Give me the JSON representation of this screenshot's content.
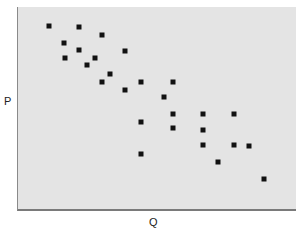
{
  "chart_data": {
    "type": "scatter",
    "title": "",
    "xlabel": "Q",
    "ylabel": "P",
    "grid": false,
    "legend": null,
    "xlim": [
      0,
      279
    ],
    "ylim": [
      0,
      204
    ],
    "background_color": "#e4e4e4",
    "marker_color": "#111111",
    "marker": "square",
    "points": [
      {
        "x": 31,
        "y": 185
      },
      {
        "x": 61,
        "y": 184
      },
      {
        "x": 84,
        "y": 176
      },
      {
        "x": 46,
        "y": 168
      },
      {
        "x": 61,
        "y": 161
      },
      {
        "x": 107,
        "y": 160
      },
      {
        "x": 47,
        "y": 153
      },
      {
        "x": 77,
        "y": 153
      },
      {
        "x": 69,
        "y": 146
      },
      {
        "x": 92,
        "y": 137
      },
      {
        "x": 84,
        "y": 129
      },
      {
        "x": 123,
        "y": 129
      },
      {
        "x": 155,
        "y": 129
      },
      {
        "x": 107,
        "y": 121
      },
      {
        "x": 146,
        "y": 114
      },
      {
        "x": 155,
        "y": 97
      },
      {
        "x": 185,
        "y": 97
      },
      {
        "x": 216,
        "y": 97
      },
      {
        "x": 123,
        "y": 89
      },
      {
        "x": 185,
        "y": 81
      },
      {
        "x": 155,
        "y": 83
      },
      {
        "x": 185,
        "y": 66
      },
      {
        "x": 216,
        "y": 66
      },
      {
        "x": 231,
        "y": 65
      },
      {
        "x": 123,
        "y": 57
      },
      {
        "x": 200,
        "y": 49
      },
      {
        "x": 246,
        "y": 32
      }
    ]
  },
  "axes": {
    "x_label": "Q",
    "y_label": "P"
  }
}
